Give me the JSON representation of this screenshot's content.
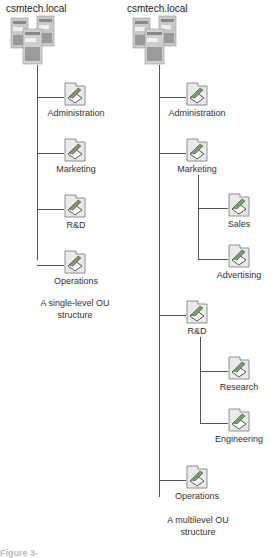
{
  "left_tree": {
    "domain": "csmtech.local",
    "ous": [
      "Administration",
      "Marketing",
      "R&D",
      "Operations"
    ],
    "caption_line1": "A single-level OU",
    "caption_line2": "structure"
  },
  "right_tree": {
    "domain": "csmtech.local",
    "ous": {
      "administration": "Administration",
      "marketing": "Marketing",
      "sales": "Sales",
      "advertising": "Advertising",
      "rd": "R&D",
      "research": "Research",
      "engineering": "Engineering",
      "operations": "Operations"
    },
    "caption_line1": "A multilevel OU",
    "caption_line2": "structure"
  },
  "footer": "Figure 3-"
}
